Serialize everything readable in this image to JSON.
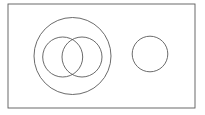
{
  "diagram": {
    "type": "venn",
    "background": "#ffffff",
    "stroke_color": "#5a5a5a",
    "universe": {
      "x": 8,
      "y": 4,
      "width": 187,
      "height": 104
    },
    "sets": [
      {
        "name": "outer-set",
        "cx": 72.5,
        "cy": 56,
        "r": 38.5
      },
      {
        "name": "inner-left-set",
        "cx": 62.7,
        "cy": 57,
        "r": 20
      },
      {
        "name": "inner-right-set",
        "cx": 82,
        "cy": 57,
        "r": 20
      },
      {
        "name": "disjoint-set",
        "cx": 150,
        "cy": 54,
        "r": 17.8
      }
    ]
  }
}
